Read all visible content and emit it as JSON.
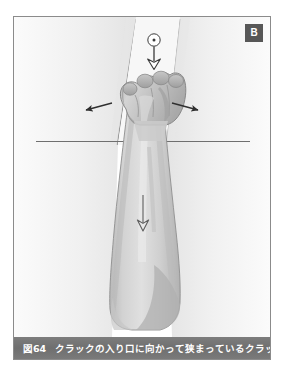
{
  "figure": {
    "panel_label": "B",
    "caption_number": "図64",
    "caption_text": "クラックの入り口に向かって狭まっているクラック",
    "colors": {
      "caption_bar": "#757575",
      "badge_bg": "#575757",
      "badge_text": "#ffffff",
      "frame_border": "#8b8b8b",
      "rock_face": "#ededed",
      "rock_shadow": "#e2e2e2",
      "skin_light": "#dcdcdc",
      "skin_mid": "#c9c9c9",
      "skin_shadow": "#b4b4b4",
      "outline": "#6e6e6e",
      "arrow": "#333333",
      "background": "#ffffff"
    }
  },
  "illustration": {
    "title": "Fist jam in a crack that narrows toward the entrance",
    "elements": [
      {
        "name": "crack-left-wall",
        "description": "Left rock wall of the crack, angling down and inward"
      },
      {
        "name": "crack-right-wall",
        "description": "Right rock wall of the crack, angling down and inward"
      },
      {
        "name": "rock-surface-line",
        "description": "Horizontal line marking the rock face surface"
      },
      {
        "name": "hand-fist",
        "description": "Clenched fist jammed into the narrowing crack"
      },
      {
        "name": "forearm",
        "description": "Forearm extending down from the fist to the elbow"
      },
      {
        "name": "arrow-down-top",
        "description": "Downward arrow above the fist with circular pivot marker"
      },
      {
        "name": "arrow-left",
        "description": "Short arrow pointing down-left from the crack"
      },
      {
        "name": "arrow-right",
        "description": "Short arrow pointing down-right from the crack"
      },
      {
        "name": "arrow-down-forearm",
        "description": "Long downward arrow along the forearm indicating load direction"
      }
    ]
  }
}
